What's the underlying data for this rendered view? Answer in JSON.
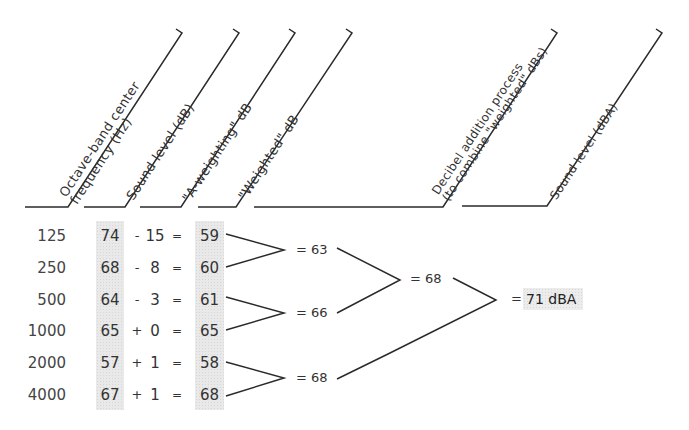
{
  "headers": [
    {
      "line1": "Octave-band center",
      "line2": "frequency (Hz)"
    },
    {
      "line1": "Sound level (dB)"
    },
    {
      "line1": "\"A-weighting\" dB"
    },
    {
      "line1": "\"Weighted\" dB"
    },
    {
      "line1": "Decibel addition process",
      "line2": "(to combine \"weighted\" dBs)"
    },
    {
      "line1": "Sound level (dBA)"
    }
  ],
  "rows": [
    {
      "frequency": "125",
      "sound_level": "74",
      "operator": "-",
      "a_weighting": "15",
      "equals": "=",
      "weighted": "59"
    },
    {
      "frequency": "250",
      "sound_level": "68",
      "operator": "-",
      "a_weighting": "8",
      "equals": "=",
      "weighted": "60"
    },
    {
      "frequency": "500",
      "sound_level": "64",
      "operator": "-",
      "a_weighting": "3",
      "equals": "=",
      "weighted": "61"
    },
    {
      "frequency": "1000",
      "sound_level": "65",
      "operator": "+",
      "a_weighting": "0",
      "equals": "=",
      "weighted": "65"
    },
    {
      "frequency": "2000",
      "sound_level": "57",
      "operator": "+",
      "a_weighting": "1",
      "equals": "=",
      "weighted": "58"
    },
    {
      "frequency": "4000",
      "sound_level": "67",
      "operator": "+",
      "a_weighting": "1",
      "equals": "=",
      "weighted": "68"
    }
  ],
  "addition": {
    "level1": [
      "= 63",
      "= 66",
      "= 68"
    ],
    "level2": [
      "= 68"
    ],
    "result_equals": "=",
    "result": "71 dBA"
  },
  "colors": {
    "line": "#2a2a2a",
    "shade": "#e9e9e9"
  }
}
